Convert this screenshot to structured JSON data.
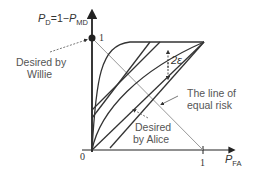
{
  "diagram": {
    "y_axis_label": {
      "p": "P",
      "sub1": "D",
      "eq": "=1−",
      "p2": "P",
      "sub2": "MD"
    },
    "x_axis_label": {
      "p": "P",
      "sub": "FA"
    },
    "origin_label": "0",
    "y_tick_label": "1",
    "x_tick_label": "1",
    "gap_label": "2ε",
    "annotations": {
      "willie_line1": "Desired by",
      "willie_line2": "Willie",
      "equal_risk_line1": "The line of",
      "equal_risk_line2": "equal risk",
      "alice_line1": "Desired",
      "alice_line2": "by Alice"
    },
    "colors": {
      "axis": "#222222",
      "curve": "#333333",
      "equal_risk_line": "#999999",
      "text": "#555555"
    }
  }
}
